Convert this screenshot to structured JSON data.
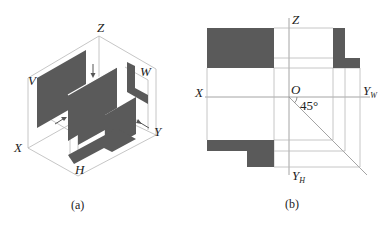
{
  "figure_a": {
    "caption": "(a)",
    "labels": {
      "z": "Z",
      "x": "X",
      "y": "Y",
      "v": "V",
      "w": "W",
      "h": "H"
    },
    "description": "Isometric view of an L-shaped object inside three projection planes V, W, H with projection arrows"
  },
  "figure_b": {
    "caption": "(b)",
    "labels": {
      "z": "Z",
      "x": "X",
      "o": "O",
      "yw": "Y",
      "yw_sub": "W",
      "yh": "Y",
      "yh_sub": "H",
      "angle": "45°"
    },
    "description": "Orthographic three-view projection: front view (top-left), side view (top-right), top view (bottom-left) with 45° miter line"
  },
  "colors": {
    "fill": "#5a5a5a",
    "line": "#b8b8b8",
    "text": "#222222",
    "background": "#ffffff"
  }
}
